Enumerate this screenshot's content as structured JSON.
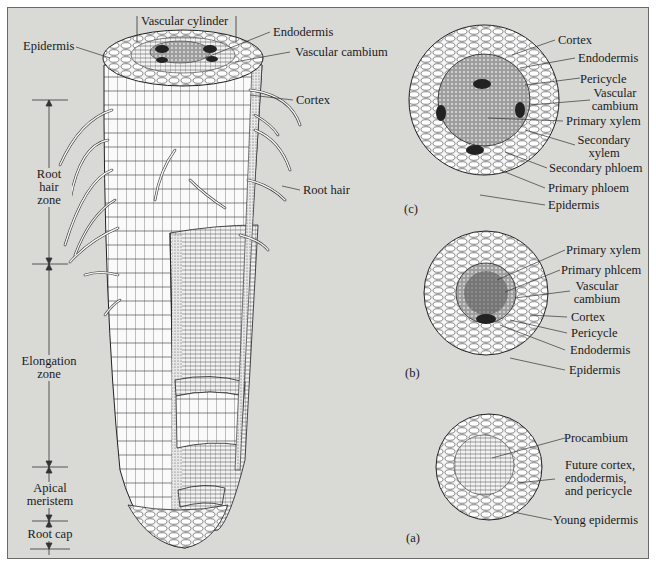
{
  "figure": {
    "background": "#d9d9d6",
    "main_root": {
      "top_labels": {
        "vascular_cylinder": "Vascular cylinder",
        "epidermis": "Epidermis",
        "endodermis": "Endodermis",
        "vascular_cambium": "Vascular cambium",
        "cortex": "Cortex",
        "root_hair": "Root hair"
      },
      "zones": [
        {
          "id": "root-hair-zone",
          "lines": [
            "Root",
            "hair",
            "zone"
          ]
        },
        {
          "id": "elongation-zone",
          "lines": [
            "Elongation",
            "zone"
          ]
        },
        {
          "id": "apical-meristem",
          "lines": [
            "Apical",
            "meristem"
          ]
        },
        {
          "id": "root-cap",
          "lines": [
            "Root cap"
          ]
        }
      ]
    },
    "cross_sections": [
      {
        "panel": "(c)",
        "labels": [
          "Cortex",
          "Endodermis",
          "Pericycle",
          "Vascular\ncambium",
          "Primary xylem",
          "Secondary\nxylem",
          "Secondary phloem",
          "Primary phloem",
          "Epidermis"
        ]
      },
      {
        "panel": "(b)",
        "labels": [
          "Primary xylem",
          "Primary phlcem",
          "Vascular\ncambium",
          "Cortex",
          "Pericycle",
          "Endodermis",
          "Epidermis"
        ]
      },
      {
        "panel": "(a)",
        "labels": [
          "Procambium",
          "Future cortex,\nendodermis,\nand pericycle",
          "Young epidermis"
        ]
      }
    ]
  },
  "labels": {
    "vascular_cylinder": "Vascular cylinder",
    "epidermis": "Epidermis",
    "endodermis": "Endodermis",
    "vascular_cambium": "Vascular cambium",
    "cortex": "Cortex",
    "root_hair": "Root hair",
    "zone_root_hair_1": "Root",
    "zone_root_hair_2": "hair",
    "zone_root_hair_3": "zone",
    "zone_elong_1": "Elongation",
    "zone_elong_2": "zone",
    "zone_apical_1": "Apical",
    "zone_apical_2": "meristem",
    "zone_cap": "Root cap",
    "c_panel": "(c)",
    "c_cortex": "Cortex",
    "c_endodermis": "Endodermis",
    "c_pericycle": "Pericycle",
    "c_vc_1": "Vascular",
    "c_vc_2": "cambium",
    "c_primary_xylem": "Primary xylem",
    "c_sx_1": "Secondary",
    "c_sx_2": "xylem",
    "c_secondary_phloem": "Secondary phloem",
    "c_primary_phloem": "Primary phloem",
    "c_epidermis": "Epidermis",
    "b_panel": "(b)",
    "b_primary_xylem": "Primary xylem",
    "b_primary_phloem": "Primary phlcem",
    "b_vc_1": "Vascular",
    "b_vc_2": "cambium",
    "b_cortex": "Cortex",
    "b_pericycle": "Pericycle",
    "b_endodermis": "Endodermis",
    "b_epidermis": "Epidermis",
    "a_panel": "(a)",
    "a_procambium": "Procambium",
    "a_future_1": "Future cortex,",
    "a_future_2": "endodermis,",
    "a_future_3": "and pericycle",
    "a_young_epidermis": "Young epidermis"
  }
}
